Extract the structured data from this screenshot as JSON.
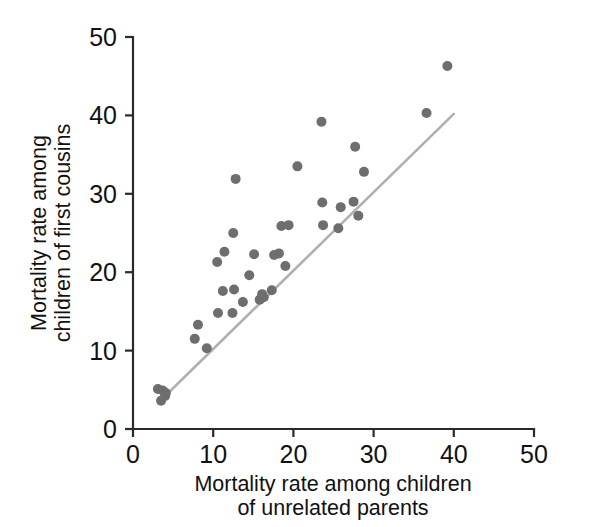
{
  "chart_data": {
    "type": "scatter",
    "title": "",
    "xlabel": "Mortality rate among children of unrelated parents",
    "xlabel_line1": "Mortality rate among children",
    "xlabel_line2": "of unrelated parents",
    "ylabel": "Mortality rate among children of first cousins",
    "ylabel_line1": "Mortality rate among",
    "ylabel_line2": "children of first cousins",
    "xlim": [
      0,
      50
    ],
    "ylim": [
      0,
      50
    ],
    "xticks": [
      0,
      10,
      20,
      30,
      40,
      50
    ],
    "yticks": [
      0,
      10,
      20,
      30,
      40,
      50
    ],
    "xtick_labels": [
      "0",
      "10",
      "20",
      "30",
      "40",
      "50"
    ],
    "ytick_labels": [
      "0",
      "10",
      "20",
      "30",
      "40",
      "50"
    ],
    "grid": false,
    "legend": "none",
    "marker_color": "#6e6e6e",
    "marker_size_px": 10,
    "reference_line": {
      "label": "equality / regression line",
      "color": "#b0b0b0",
      "x": [
        3.4,
        40.0
      ],
      "y": [
        3.6,
        40.2
      ]
    },
    "points": [
      {
        "x": 3.1,
        "y": 5.1
      },
      {
        "x": 3.7,
        "y": 4.9
      },
      {
        "x": 3.5,
        "y": 3.6
      },
      {
        "x": 4.0,
        "y": 4.2
      },
      {
        "x": 4.1,
        "y": 4.6
      },
      {
        "x": 7.7,
        "y": 11.5
      },
      {
        "x": 8.1,
        "y": 13.3
      },
      {
        "x": 9.2,
        "y": 10.3
      },
      {
        "x": 10.5,
        "y": 21.3
      },
      {
        "x": 10.6,
        "y": 14.8
      },
      {
        "x": 11.4,
        "y": 22.6
      },
      {
        "x": 11.2,
        "y": 17.6
      },
      {
        "x": 12.5,
        "y": 25.0
      },
      {
        "x": 12.6,
        "y": 17.8
      },
      {
        "x": 12.4,
        "y": 14.8
      },
      {
        "x": 12.8,
        "y": 31.9
      },
      {
        "x": 13.7,
        "y": 16.2
      },
      {
        "x": 14.5,
        "y": 19.6
      },
      {
        "x": 15.1,
        "y": 22.3
      },
      {
        "x": 15.8,
        "y": 16.5
      },
      {
        "x": 16.1,
        "y": 17.2
      },
      {
        "x": 16.3,
        "y": 16.8
      },
      {
        "x": 17.3,
        "y": 17.7
      },
      {
        "x": 17.6,
        "y": 22.2
      },
      {
        "x": 18.2,
        "y": 22.4
      },
      {
        "x": 18.5,
        "y": 25.9
      },
      {
        "x": 19.0,
        "y": 20.8
      },
      {
        "x": 19.4,
        "y": 26.0
      },
      {
        "x": 20.5,
        "y": 33.5
      },
      {
        "x": 23.5,
        "y": 39.2
      },
      {
        "x": 23.6,
        "y": 28.9
      },
      {
        "x": 23.7,
        "y": 26.0
      },
      {
        "x": 25.6,
        "y": 25.6
      },
      {
        "x": 25.9,
        "y": 28.3
      },
      {
        "x": 27.5,
        "y": 29.0
      },
      {
        "x": 27.7,
        "y": 36.0
      },
      {
        "x": 28.1,
        "y": 27.2
      },
      {
        "x": 28.8,
        "y": 32.8
      },
      {
        "x": 36.6,
        "y": 40.3
      },
      {
        "x": 39.2,
        "y": 46.3
      }
    ]
  },
  "axes": {
    "x_axis_name": "x-axis",
    "y_axis_name": "y-axis"
  }
}
